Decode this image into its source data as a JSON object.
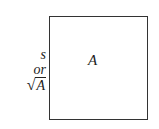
{
  "diagram": {
    "shape": "square",
    "area_label": "A",
    "side_label": {
      "line1": "s",
      "line2": "or",
      "radical_symbol": "√",
      "radicand": "A"
    },
    "colors": {
      "stroke": "#333333",
      "background": "#ffffff"
    }
  }
}
